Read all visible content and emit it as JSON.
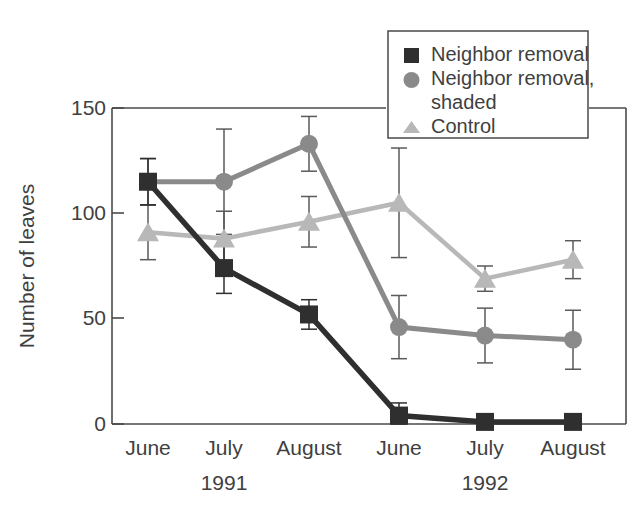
{
  "chart_data": {
    "type": "line",
    "title": "",
    "subtitle": "",
    "xlabel": "",
    "ylabel": "Number of leaves",
    "categories": [
      "June",
      "July",
      "August",
      "June",
      "July",
      "August"
    ],
    "group_labels": [
      "1991",
      "1992"
    ],
    "ylim": [
      0,
      150
    ],
    "yticks": [
      0,
      50,
      100,
      150
    ],
    "ytick_labels": [
      "0",
      "50",
      "100",
      "150"
    ],
    "grid": false,
    "legend_position": "top-right",
    "series": [
      {
        "name": "Neighbor removal",
        "marker": "square",
        "color": "#2f2f2f",
        "values": [
          115,
          74,
          52,
          4,
          1,
          1
        ],
        "err_low": [
          104,
          62,
          45,
          0,
          0,
          0
        ],
        "err_high": [
          126,
          86,
          59,
          10,
          3,
          3
        ]
      },
      {
        "name": "Neighbor removal, shaded",
        "marker": "circle",
        "color": "#8a8a8a",
        "values": [
          115,
          115,
          133,
          46,
          42,
          40
        ],
        "err_low": [
          104,
          90,
          120,
          31,
          29,
          26
        ],
        "err_high": [
          126,
          140,
          146,
          61,
          55,
          54
        ]
      },
      {
        "name": "Control",
        "marker": "triangle",
        "color": "#b8b8b8",
        "values": [
          91,
          88,
          96,
          105,
          69,
          78
        ],
        "err_low": [
          78,
          76,
          84,
          79,
          63,
          69
        ],
        "err_high": [
          104,
          101,
          108,
          131,
          75,
          87
        ]
      }
    ]
  },
  "legend": {
    "entries": [
      {
        "label": "Neighbor removal",
        "marker": "square-marker",
        "color": "#2f2f2f"
      },
      {
        "label": "Neighbor removal,",
        "label2": "shaded",
        "marker": "circle-marker",
        "color": "#8a8a8a"
      },
      {
        "label": "Control",
        "marker": "triangle-marker",
        "color": "#b8b8b8"
      }
    ]
  },
  "axes": {
    "y_label": "Number of leaves",
    "y_ticks": [
      "150",
      "100",
      "50",
      "0"
    ],
    "x_ticks": [
      "June",
      "July",
      "August",
      "June",
      "July",
      "August"
    ],
    "x_groups": [
      "1991",
      "1992"
    ]
  }
}
